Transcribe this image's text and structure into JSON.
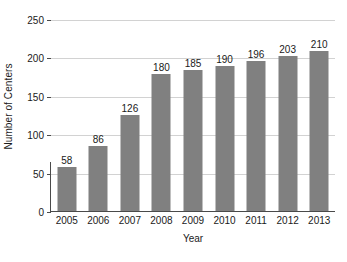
{
  "chart_data": {
    "type": "bar",
    "title": "",
    "xlabel": "Year",
    "ylabel": "Number of Centers",
    "categories": [
      "2005",
      "2006",
      "2007",
      "2008",
      "2009",
      "2010",
      "2011",
      "2012",
      "2013"
    ],
    "values": [
      58,
      86,
      126,
      180,
      185,
      190,
      196,
      203,
      210
    ],
    "value_labels": [
      "58",
      "86",
      "126",
      "180",
      "185",
      "190",
      "196",
      "203",
      "210"
    ],
    "ylim": [
      0,
      250
    ],
    "ytick_labels": [
      "0",
      "50",
      "100",
      "150",
      "200",
      "250"
    ],
    "ytick_values": [
      0,
      50,
      100,
      150,
      200,
      250
    ],
    "grid": "horizontal",
    "legend": "none",
    "colors": {
      "bar": "#808080",
      "gridline": "#d2d2d2",
      "axis": "#4a4a4a",
      "text": "#1a1a1a",
      "background": "#ffffff"
    }
  }
}
